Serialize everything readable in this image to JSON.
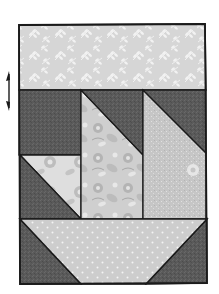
{
  "diagram": {
    "colors": {
      "background": "#ffffff",
      "outline": "#1a1a1a",
      "dark": "#5a5a5a",
      "leaf_print": "#d6d6d6",
      "leaf_motif": "#f2f2f2",
      "floral_light": "#dcdcdc",
      "floral_mid": "#bdbdbd",
      "speckle": "#c8c8c8",
      "dot_print": "#cfcfcf",
      "dot": "#f4f4f4"
    },
    "pieces": [
      {
        "id": "top-band",
        "fabric": "leaf print"
      },
      {
        "id": "left-upper-square",
        "fabric": "dark"
      },
      {
        "id": "left-lower-half-square-light",
        "fabric": "floral light"
      },
      {
        "id": "left-lower-half-square-dark",
        "fabric": "dark"
      },
      {
        "id": "middle-column-dark-triangle",
        "fabric": "dark"
      },
      {
        "id": "middle-column-floral",
        "fabric": "floral"
      },
      {
        "id": "right-column-dark-triangle",
        "fabric": "dark"
      },
      {
        "id": "right-column-speckle",
        "fabric": "speckle"
      },
      {
        "id": "basket-base",
        "fabric": "dot print"
      },
      {
        "id": "basket-left-corner",
        "fabric": "dark"
      },
      {
        "id": "basket-right-corner",
        "fabric": "dark"
      }
    ],
    "icons": {
      "rotate_arrow": "double-headed vertical arrow"
    }
  }
}
